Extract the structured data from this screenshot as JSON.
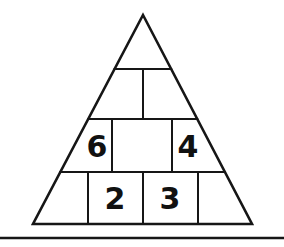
{
  "figure": {
    "background_color": "#ffffff",
    "stroke_color": "#161616",
    "text_color": "#111111",
    "canvas": {
      "width": 284,
      "height": 247
    },
    "triangle": {
      "apex": {
        "x": 143,
        "y": 15
      },
      "base_left": {
        "x": 33,
        "y": 224
      },
      "base_right": {
        "x": 252,
        "y": 224
      },
      "outline_stroke_width": 2.6
    },
    "row_divider_y": [
      69,
      119,
      172
    ],
    "inner_stroke_width": 2.0,
    "rows": [
      {
        "index": 1,
        "name": "apex-row",
        "top_y": 15,
        "bottom_y": 69,
        "cells": [
          {
            "index": 1,
            "value": "",
            "cx": 143,
            "cy": 45
          }
        ],
        "divider_x": []
      },
      {
        "index": 2,
        "name": "second-row",
        "top_y": 69,
        "bottom_y": 119,
        "cells": [
          {
            "index": 1,
            "value": "",
            "cx": 130,
            "cy": 94
          },
          {
            "index": 2,
            "value": "",
            "cx": 157,
            "cy": 94
          }
        ],
        "divider_x": [
          143
        ]
      },
      {
        "index": 3,
        "name": "third-row",
        "top_y": 119,
        "bottom_y": 172,
        "cells": [
          {
            "index": 1,
            "value": "6",
            "cx": 97,
            "cy": 147
          },
          {
            "index": 2,
            "value": "",
            "cx": 142,
            "cy": 147
          },
          {
            "index": 3,
            "value": "4",
            "cx": 188,
            "cy": 147
          }
        ],
        "divider_x": [
          112,
          172
        ]
      },
      {
        "index": 4,
        "name": "bottom-row",
        "top_y": 172,
        "bottom_y": 224,
        "cells": [
          {
            "index": 1,
            "value": "",
            "cx": 67,
            "cy": 199
          },
          {
            "index": 2,
            "value": "2",
            "cx": 115,
            "cy": 199
          },
          {
            "index": 3,
            "value": "3",
            "cx": 170,
            "cy": 199
          },
          {
            "index": 4,
            "value": "",
            "cx": 225,
            "cy": 199
          }
        ],
        "divider_x": [
          88,
          143,
          198
        ]
      }
    ],
    "footer_rule": {
      "y": 238,
      "x_start": 0,
      "x_end": 284,
      "stroke_width": 2.4,
      "color": "#161616"
    },
    "visible_numbers": [
      "6",
      "4",
      "2",
      "3"
    ]
  }
}
